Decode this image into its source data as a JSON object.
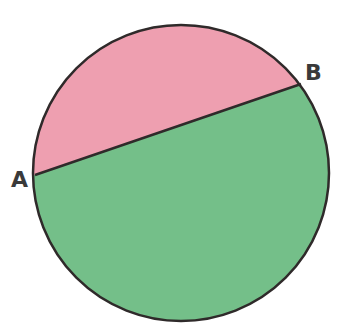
{
  "diagram": {
    "type": "circle-chord",
    "circle": {
      "cx": 181,
      "cy": 173,
      "r": 148,
      "stroke": "#2f2a2a"
    },
    "chord": {
      "from": "A",
      "to": "B"
    },
    "points": [
      {
        "id": "A",
        "label": "A",
        "x": 35,
        "y": 175
      },
      {
        "id": "B",
        "label": "B",
        "x": 301,
        "y": 84
      }
    ],
    "regions": [
      {
        "name": "minor-segment",
        "color": "#ee9fb0"
      },
      {
        "name": "major-segment",
        "color": "#74bf89"
      }
    ]
  }
}
